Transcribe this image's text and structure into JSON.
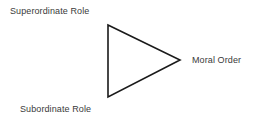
{
  "diagram": {
    "title_text": "",
    "background_color": "#ffffff",
    "stroke_color": "#1a1a1a",
    "text_color": "#3a3a3a",
    "shape": {
      "name": "triangle",
      "orientation": "pointing-right",
      "fill": "none",
      "stroke_width": 1.6,
      "vertices": [
        {
          "x": 108,
          "y": 25
        },
        {
          "x": 180,
          "y": 60
        },
        {
          "x": 108,
          "y": 97
        }
      ]
    },
    "labels": {
      "superordinate": "Superordinate Role",
      "subordinate": "Subordinate Role",
      "moral_order": "Moral Order"
    }
  }
}
